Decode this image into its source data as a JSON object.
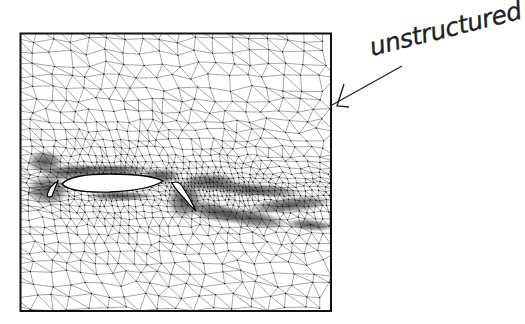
{
  "figure": {
    "frame": {
      "x": 20,
      "y": 33,
      "width": 311,
      "height": 278
    },
    "colors": {
      "ink": "#1a1a1a",
      "mesh": "#3a3a3a",
      "paper": "#ffffff"
    },
    "elements": {
      "slat": {
        "label": "slat"
      },
      "main": {
        "label": "main-element"
      },
      "flap": {
        "label": "flap"
      }
    }
  },
  "annotation": {
    "text": "unstructured",
    "style": "handwritten"
  }
}
